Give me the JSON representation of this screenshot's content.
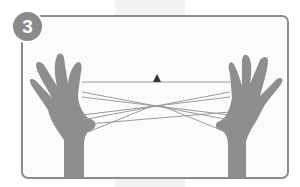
{
  "step": {
    "number": "3"
  },
  "illustration": {
    "subject": "two-hands-string-figure",
    "marker": "triangle",
    "colors": {
      "frame": "#8c8c8c",
      "badge": "#8a8a8a",
      "skin": "#8e8e8e",
      "string": "#9a9a9a",
      "marker": "#333333"
    }
  }
}
